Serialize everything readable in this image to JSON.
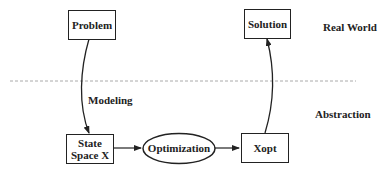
{
  "diagram": {
    "nodes": {
      "problem": "Problem",
      "solution": "Solution",
      "state_space": "State Space X",
      "state_space_line1": "State",
      "state_space_line2": "Space X",
      "optimization": "Optimization",
      "xopt": "Xopt"
    },
    "edge_labels": {
      "modeling": "Modeling"
    },
    "regions": {
      "real_world": "Real World",
      "abstraction": "Abstraction"
    },
    "edges": [
      {
        "from": "Problem",
        "to": "State Space X",
        "label": "Modeling"
      },
      {
        "from": "State Space X",
        "to": "Optimization"
      },
      {
        "from": "Optimization",
        "to": "Xopt"
      },
      {
        "from": "Xopt",
        "to": "Solution"
      }
    ],
    "colors": {
      "stroke": "#222222",
      "divider": "#aaaaaa",
      "background": "#ffffff"
    }
  }
}
